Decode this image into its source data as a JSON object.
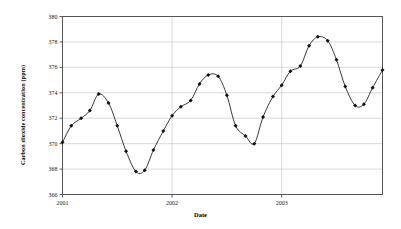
{
  "chart_data": {
    "type": "line",
    "title": "",
    "xlabel": "Date",
    "ylabel": "Carbon dioxide concentration (ppm)",
    "ylim": [
      366,
      380
    ],
    "xlim": [
      2001.0,
      2003.92
    ],
    "yticks": [
      366,
      368,
      370,
      372,
      374,
      376,
      378,
      380
    ],
    "xticks": [
      2001,
      2002,
      2003
    ],
    "xtick_labels": [
      "2001",
      "2002",
      "2003"
    ],
    "grid": "horizontal",
    "marker": "filled-diamond",
    "line_color": "#222222",
    "marker_color": "#111111",
    "grid_color": "#c9c9c9",
    "frame_color": "#555555",
    "series": [
      {
        "name": "Carbon dioxide concentration",
        "x": [
          2001.0,
          2001.08,
          2001.17,
          2001.25,
          2001.33,
          2001.42,
          2001.5,
          2001.58,
          2001.67,
          2001.75,
          2001.83,
          2001.92,
          2002.0,
          2002.08,
          2002.17,
          2002.25,
          2002.33,
          2002.42,
          2002.5,
          2002.58,
          2002.67,
          2002.75,
          2002.83,
          2002.92,
          2003.0,
          2003.08,
          2003.17,
          2003.25,
          2003.33,
          2003.42,
          2003.5,
          2003.58,
          2003.67,
          2003.75,
          2003.83,
          2003.92
        ],
        "values": [
          370.1,
          371.4,
          372.0,
          372.6,
          373.9,
          373.2,
          371.4,
          369.4,
          367.8,
          367.9,
          369.5,
          371.0,
          372.2,
          372.9,
          373.4,
          374.7,
          375.4,
          375.3,
          373.8,
          371.4,
          370.6,
          370.0,
          372.1,
          373.7,
          374.6,
          375.7,
          376.1,
          377.7,
          378.4,
          378.1,
          376.6,
          374.5,
          373.0,
          373.1,
          374.4,
          375.8
        ]
      }
    ]
  },
  "axes": {
    "y_tick_labels": [
      "380",
      "378",
      "376",
      "374",
      "372",
      "370",
      "368",
      "366"
    ],
    "x_tick_labels": [
      "2001",
      "2002",
      "2003"
    ],
    "x_axis_title": "Date",
    "y_axis_title": "Carbon dioxide concentration (ppm)"
  }
}
